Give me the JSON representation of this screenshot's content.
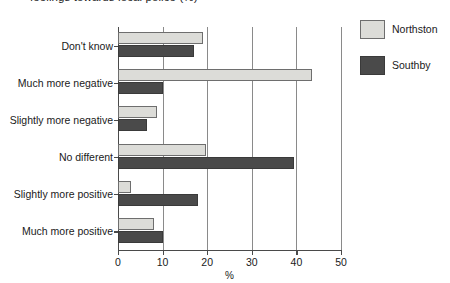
{
  "chart_data": {
    "type": "bar",
    "orientation": "horizontal",
    "title": "feelings towards local police (%)",
    "xlabel": "%",
    "ylabel": "",
    "xlim": [
      0,
      50
    ],
    "xticks": [
      0,
      10,
      20,
      30,
      40,
      50
    ],
    "grid": "vertical",
    "legend_position": "top-right",
    "categories": [
      "Don't know",
      "Much more negative",
      "Slightly more negative",
      "No different",
      "Slightly more positive",
      "Much more positive"
    ],
    "series": [
      {
        "name": "Northston",
        "color": "#dcdcd8",
        "values": [
          19,
          43.5,
          8.7,
          19.7,
          3,
          8
        ]
      },
      {
        "name": "Southby",
        "color": "#4a4a4a",
        "values": [
          17,
          10,
          6.5,
          39.5,
          18,
          10
        ]
      }
    ]
  },
  "legend": {
    "items": [
      {
        "label": "Northston",
        "color": "#dcdcd8"
      },
      {
        "label": "Southby",
        "color": "#4a4a4a"
      }
    ]
  },
  "axis": {
    "x_title": "%",
    "tick_labels": [
      "0",
      "10",
      "20",
      "30",
      "40",
      "50"
    ]
  }
}
